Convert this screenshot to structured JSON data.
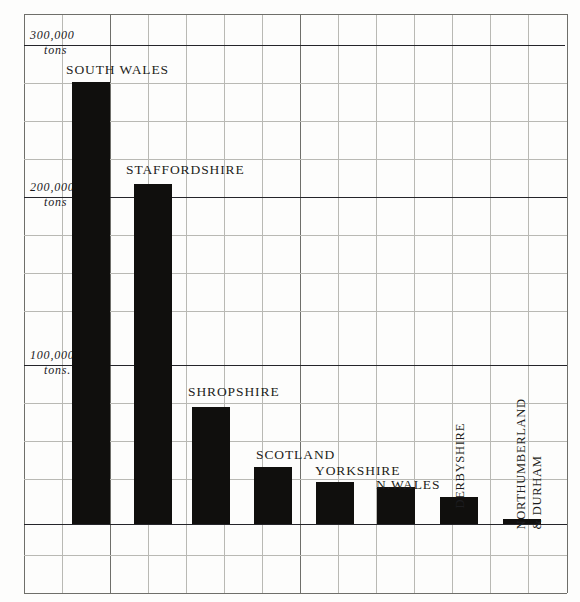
{
  "chart_data": {
    "type": "bar",
    "title": "",
    "xlabel": "",
    "ylabel": "tons",
    "ylim": [
      0,
      300000
    ],
    "grid": true,
    "legend_position": "none",
    "categories": [
      "SOUTH  WALES",
      "STAFFORDSHIRE",
      "SHROPSHIRE",
      "SCOTLAND",
      "YORKSHIRE",
      "N.WALES",
      "DERBYSHIRE",
      "NORTHUMBERLAND & DURHAM"
    ],
    "values": [
      277000,
      213000,
      73000,
      36000,
      26000,
      23000,
      17000,
      3000
    ],
    "ytick_labels": [
      "300,000 tons",
      "200,000 tons",
      "100,000 tons."
    ],
    "ytick_values": [
      300000,
      200000,
      100000
    ],
    "bar_color": "#100f0d"
  },
  "axis": {
    "ticks": [
      {
        "number": "300,000",
        "unit": "tons"
      },
      {
        "number": "200,000",
        "unit": "tons"
      },
      {
        "number": "100,000",
        "unit": "tons."
      }
    ]
  },
  "bars": [
    {
      "label": "SOUTH  WALES",
      "value": 277000,
      "orientation": "horizontal"
    },
    {
      "label": "STAFFORDSHIRE",
      "value": 213000,
      "orientation": "horizontal"
    },
    {
      "label": "SHROPSHIRE",
      "value": 73000,
      "orientation": "horizontal"
    },
    {
      "label": "SCOTLAND",
      "value": 36000,
      "orientation": "horizontal"
    },
    {
      "label": "YORKSHIRE",
      "value": 26000,
      "orientation": "horizontal"
    },
    {
      "label": "N.WALES",
      "value": 23000,
      "orientation": "horizontal"
    },
    {
      "label": "DERBYSHIRE",
      "value": 17000,
      "orientation": "vertical"
    },
    {
      "label": "NORTHUMBERLAND",
      "label2": "& DURHAM",
      "value": 3000,
      "orientation": "vertical"
    }
  ],
  "colors": {
    "bar": "#100f0d",
    "grid": "#b9b9b4",
    "frame": "#6f6f6a",
    "rule": "#25252a",
    "paper": "#fdfdfc",
    "ink": "#1d1d20"
  }
}
